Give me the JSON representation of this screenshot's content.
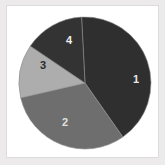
{
  "figure": {
    "background_color": "#eceaea",
    "panel_color": "#ffffff",
    "panel_border_color": "#dcdcdc"
  },
  "chart_data": {
    "type": "pie",
    "title": "",
    "subtitle": "",
    "xlabel": "",
    "ylabel": "",
    "grid": false,
    "legend": false,
    "legend_position": "none",
    "labels_inside_slices": true,
    "start_angle_deg": 357,
    "direction": "clockwise",
    "center": {
      "x": 78,
      "y": 77
    },
    "radius": 66,
    "categories": [
      "1",
      "2",
      "3",
      "4"
    ],
    "values": [
      41,
      31,
      13,
      15
    ],
    "units": "percent",
    "slices": [
      {
        "label": "1",
        "value": 41,
        "percent": 41,
        "color": "#2f2f2f",
        "label_color": "#e8e8e8",
        "start_deg": 357,
        "end_deg": 505,
        "label_x": 129,
        "label_y": 73
      },
      {
        "label": "2",
        "value": 31,
        "percent": 31,
        "color": "#6e6e6e",
        "label_color": "#e0e0e0",
        "start_deg": 505,
        "end_deg": 617,
        "label_x": 58,
        "label_y": 116
      },
      {
        "label": "3",
        "value": 13,
        "percent": 13,
        "color": "#adadad",
        "label_color": "#2b2b2b",
        "start_deg": 617,
        "end_deg": 664,
        "label_x": 36,
        "label_y": 59
      },
      {
        "label": "4",
        "value": 15,
        "percent": 15,
        "color": "#333333",
        "label_color": "#f0f0f0",
        "start_deg": 664,
        "end_deg": 717,
        "label_x": 62,
        "label_y": 34
      }
    ],
    "slice_edge_color": "#8c8c8c",
    "slice_edge_width": 0.6
  }
}
